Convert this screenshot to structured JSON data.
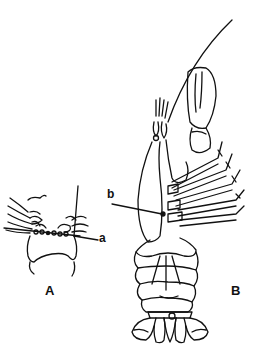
{
  "figure": {
    "panels": [
      {
        "id": "A",
        "label": "A",
        "pointers": [
          {
            "label": "a"
          }
        ]
      },
      {
        "id": "B",
        "label": "B",
        "pointers": [
          {
            "label": "b"
          }
        ]
      }
    ]
  },
  "colors": {
    "line": "#111111",
    "background": "#ffffff"
  }
}
